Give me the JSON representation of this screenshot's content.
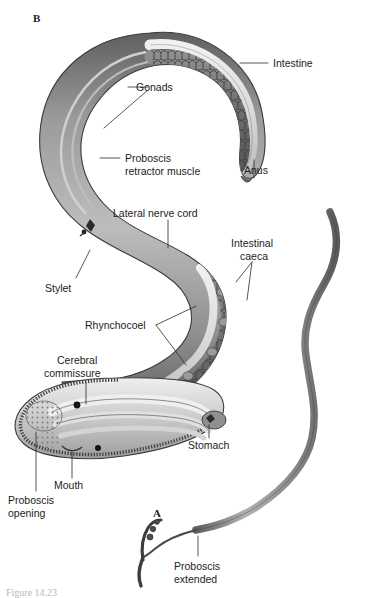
{
  "figure": {
    "caption_partial": "Figure 14.23",
    "panels": [
      {
        "id": "A",
        "letter": "A",
        "description": "Proboscis extended"
      },
      {
        "id": "B",
        "letter": "B",
        "description": "Internal anatomy of coiled body"
      }
    ]
  },
  "labels": {
    "intestine": "Intestine",
    "gonads": "Gonads",
    "anus": "Anus",
    "proboscis_retractor_muscle_line1": "Proboscis",
    "proboscis_retractor_muscle_line2": "retractor muscle",
    "lateral_nerve_cord": "Lateral nerve cord",
    "intestinal_caeca_line1": "Intestinal",
    "intestinal_caeca_line2": "caeca",
    "stylet": "Stylet",
    "rhynchocoel": "Rhynchocoel",
    "cerebral_commissure_line1": "Cerebral",
    "cerebral_commissure_line2": "commissure",
    "stomach": "Stomach",
    "mouth": "Mouth",
    "proboscis_opening_line1": "Proboscis",
    "proboscis_opening_line2": "opening",
    "proboscis_extended_line1": "Proboscis",
    "proboscis_extended_line2": "extended"
  },
  "colors": {
    "background": "#ffffff",
    "ink": "#1c1c1c",
    "leader": "#2a2a2a",
    "body_wall_dark": "#6e6e6e",
    "body_wall_mid": "#8d8d8d",
    "body_wall_light": "#c9c9c9",
    "lumen_pale": "#e3e3e3",
    "gut_shade": "#7a7a7a",
    "proboscis_gray": "#8a8a8a",
    "caption_gray": "#b8b8b8"
  }
}
